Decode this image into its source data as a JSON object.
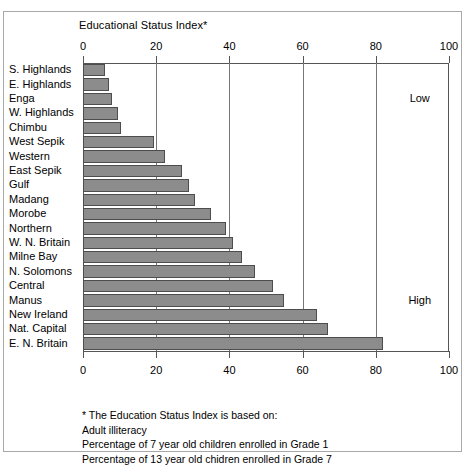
{
  "chart_data": {
    "type": "bar",
    "orientation": "horizontal",
    "title": "Educational Status Index*",
    "xlabel": "",
    "ylabel": "",
    "xlim": [
      0,
      100
    ],
    "xticks": [
      0,
      20,
      40,
      60,
      80,
      100
    ],
    "xtick_labels": [
      "0",
      "20",
      "40",
      "60",
      "80",
      "100"
    ],
    "grid": true,
    "grid_axis": "x",
    "legend": "none",
    "bar_color": "#8c8c8c",
    "bar_edge_color": "#4d4d4d",
    "categories": [
      "S. Highlands",
      "E. Highlands",
      "Enga",
      "W. Highlands",
      "Chimbu",
      "West Sepik",
      "Western",
      "East Sepik",
      "Gulf",
      "Madang",
      "Morobe",
      "Northern",
      "W. N. Britain",
      "Milne Bay",
      "N. Solomons",
      "Central",
      "Manus",
      "New Ireland",
      "Nat. Capital",
      "E. N. Britain"
    ],
    "values": [
      6,
      7,
      8,
      9.5,
      10.5,
      19.5,
      22.5,
      27,
      29,
      30.5,
      35,
      39,
      41,
      43.5,
      47,
      52,
      55,
      64,
      67,
      82
    ],
    "annotations": [
      {
        "text": "Low",
        "x": 92,
        "y_category": "Enga"
      },
      {
        "text": "High",
        "x": 92,
        "y_category": "Manus"
      }
    ]
  },
  "footnote": {
    "lines": [
      "* The Education Status Index is based on:",
      "Adult illiteracy",
      "Percentage of 7 year old children enrolled in Grade 1",
      "Percentage of 13 year old chidren enrolled in Grade 7"
    ]
  }
}
